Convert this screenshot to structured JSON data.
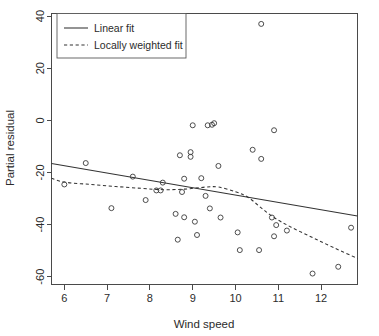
{
  "chart_data": {
    "type": "scatter",
    "title": "",
    "xlabel": "Wind speed",
    "ylabel": "Partial residual",
    "xlim": [
      5.7,
      12.85
    ],
    "ylim": [
      -63,
      41
    ],
    "xticks": [
      6,
      7,
      8,
      9,
      10,
      11,
      12
    ],
    "yticks": [
      40,
      20,
      0,
      -20,
      -40,
      -60
    ],
    "xtick_labels": [
      "6",
      "7",
      "8",
      "9",
      "10",
      "11",
      "12"
    ],
    "ytick_labels": [
      "40",
      "20",
      "0",
      "-20",
      "-40",
      "-60"
    ],
    "grid": false,
    "legend_position": "top-left",
    "marker": "open-circle",
    "points": [
      {
        "x": 6.0,
        "y": -24.6
      },
      {
        "x": 6.5,
        "y": -16.4
      },
      {
        "x": 7.1,
        "y": -33.7
      },
      {
        "x": 7.6,
        "y": -21.6
      },
      {
        "x": 7.9,
        "y": -30.6
      },
      {
        "x": 8.15,
        "y": -26.9
      },
      {
        "x": 8.25,
        "y": -26.9
      },
      {
        "x": 8.3,
        "y": -23.9
      },
      {
        "x": 8.6,
        "y": -35.9
      },
      {
        "x": 8.65,
        "y": -45.8
      },
      {
        "x": 8.7,
        "y": -13.4
      },
      {
        "x": 8.75,
        "y": -27.5
      },
      {
        "x": 8.8,
        "y": -37.2
      },
      {
        "x": 8.8,
        "y": -22.4
      },
      {
        "x": 8.95,
        "y": -14.0
      },
      {
        "x": 8.95,
        "y": -12.2
      },
      {
        "x": 9.0,
        "y": -1.9
      },
      {
        "x": 9.05,
        "y": -38.9
      },
      {
        "x": 9.1,
        "y": -44.0
      },
      {
        "x": 9.2,
        "y": -22.2
      },
      {
        "x": 9.3,
        "y": -29.0
      },
      {
        "x": 9.35,
        "y": -1.9
      },
      {
        "x": 9.4,
        "y": -33.8
      },
      {
        "x": 9.45,
        "y": -1.7
      },
      {
        "x": 9.5,
        "y": -1.1
      },
      {
        "x": 9.6,
        "y": -17.5
      },
      {
        "x": 9.65,
        "y": -37.3
      },
      {
        "x": 10.05,
        "y": -43.0
      },
      {
        "x": 10.1,
        "y": -49.8
      },
      {
        "x": 10.4,
        "y": -11.3
      },
      {
        "x": 10.55,
        "y": -49.8
      },
      {
        "x": 10.6,
        "y": 37.0
      },
      {
        "x": 10.6,
        "y": -14.8
      },
      {
        "x": 10.85,
        "y": -37.3
      },
      {
        "x": 10.9,
        "y": -3.8
      },
      {
        "x": 10.9,
        "y": -44.5
      },
      {
        "x": 10.95,
        "y": -40.2
      },
      {
        "x": 11.2,
        "y": -42.3
      },
      {
        "x": 11.8,
        "y": -58.8
      },
      {
        "x": 12.4,
        "y": -56.2
      },
      {
        "x": 12.7,
        "y": -41.2
      }
    ],
    "linear_fit": {
      "name": "Linear fit",
      "style": "solid",
      "endpoints": [
        {
          "x": 5.7,
          "y": -16.6
        },
        {
          "x": 12.85,
          "y": -36.7
        }
      ]
    },
    "loess_fit": {
      "name": "Locally weighted fit",
      "style": "dashed",
      "path": [
        {
          "x": 5.7,
          "y": -22.2
        },
        {
          "x": 6.0,
          "y": -23.7
        },
        {
          "x": 6.6,
          "y": -24.6
        },
        {
          "x": 7.2,
          "y": -25.4
        },
        {
          "x": 7.8,
          "y": -26.1
        },
        {
          "x": 8.3,
          "y": -26.6
        },
        {
          "x": 8.8,
          "y": -26.4
        },
        {
          "x": 9.3,
          "y": -25.6
        },
        {
          "x": 9.6,
          "y": -25.6
        },
        {
          "x": 10.0,
          "y": -27.4
        },
        {
          "x": 10.3,
          "y": -29.6
        },
        {
          "x": 10.6,
          "y": -33.6
        },
        {
          "x": 10.9,
          "y": -37.3
        },
        {
          "x": 11.3,
          "y": -41.0
        },
        {
          "x": 11.8,
          "y": -45.0
        },
        {
          "x": 12.3,
          "y": -48.9
        },
        {
          "x": 12.85,
          "y": -53.0
        }
      ]
    },
    "legend": {
      "entries": [
        {
          "label": "Linear fit",
          "style": "solid"
        },
        {
          "label": "Locally weighted fit",
          "style": "dashed"
        }
      ]
    }
  }
}
